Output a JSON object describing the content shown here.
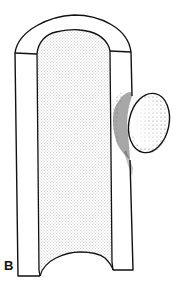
{
  "figure": {
    "panel_label": "B",
    "colors": {
      "line": "#111111",
      "background": "#ffffff",
      "stipple": "#7a7a7a",
      "dense_stipple": "#222222"
    }
  }
}
